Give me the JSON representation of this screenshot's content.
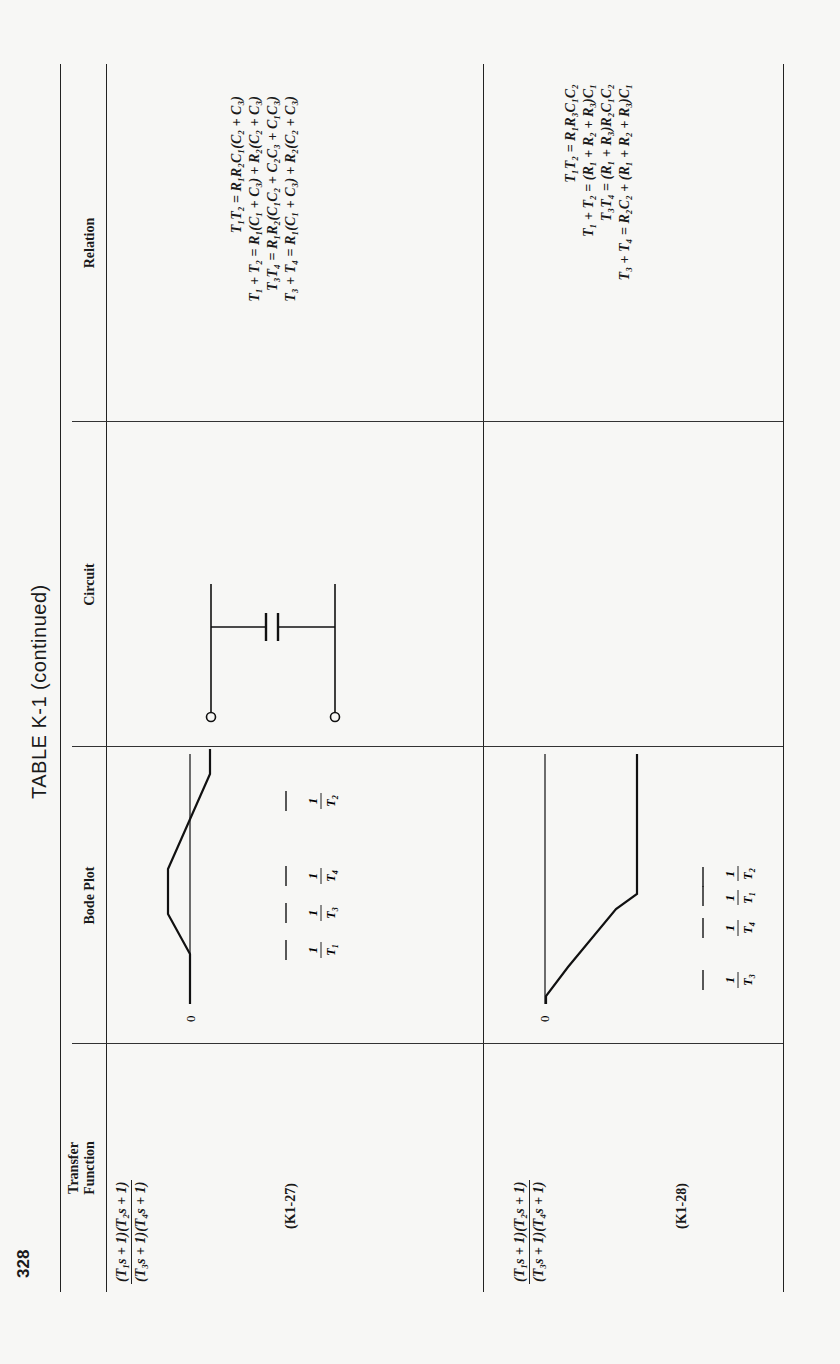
{
  "page": {
    "number": "328",
    "title": "TABLE K-1 (continued)"
  },
  "table": {
    "headers": {
      "transfer_function": [
        "Transfer",
        "Function"
      ],
      "bode_plot": "Bode Plot",
      "circuit": "Circuit",
      "relation": "Relation"
    },
    "rows": [
      {
        "id": "K1-27",
        "equation_label": "(K1-27)",
        "transfer_function": {
          "numerator": "(T₁s + 1)(T₂s + 1)",
          "denominator": "(T₃s + 1)(T₄s + 1)"
        },
        "bode_plot": {
          "origin_label": "0",
          "breakpoints_in_order": [
            "1/T₁",
            "1/T₃",
            "1/T₄",
            "1/T₂"
          ],
          "shape": "lag-lead: dips below 0 dB between 1/T₃ and 1/T₄, returns to 0 dB after 1/T₂"
        },
        "circuit": {
          "components": [
            "C₁",
            "R₁",
            "C₃",
            "R₂",
            "C₂"
          ]
        },
        "relation": [
          "T₁T₂ = R₁R₂C₁(C₂ + C₃)",
          "T₁ + T₂ = R₁(C₁ + C₃) + R₂(C₂ + C₃)",
          "T₃T₄ = R₁R₂(C₁C₂ + C₂C₃ + C₁C₃)",
          "T₃ + T₄ = R₁(C₁ + C₃) + R₂(C₂ + C₃)"
        ]
      },
      {
        "id": "K1-28",
        "equation_label": "(K1-28)",
        "transfer_function": {
          "numerator": "(T₁s + 1)(T₂s + 1)",
          "denominator": "(T₃s + 1)(T₄s + 1)"
        },
        "bode_plot": {
          "origin_label": "0",
          "breakpoints_in_order": [
            "1/T₃",
            "1/T₄",
            "1/T₁",
            "1/T₂"
          ],
          "shape": "lag: drops from 0 dB after 1/T₃, levels off after 1/T₂"
        },
        "circuit": {
          "components": [
            "C₁",
            "R₁",
            "R₃",
            "R₂",
            "C₂"
          ]
        },
        "relation": [
          "T₁T₂ = R₁R₃C₁C₂",
          "T₁ + T₂ = (R₁ + R₂ + R₃)C₁",
          "T₃T₄ = (R₁ + R₃)R₂C₁C₂",
          "T₃ + T₄ = R₂C₂ + (R₁ + R₂ + R₃)C₁"
        ]
      }
    ]
  }
}
